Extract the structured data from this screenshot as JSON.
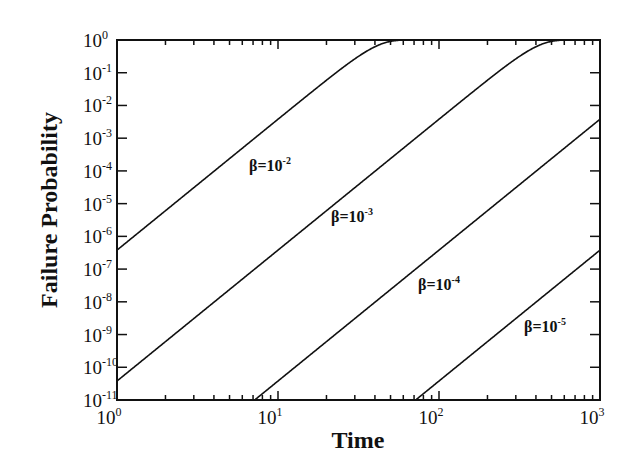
{
  "chart_data": {
    "type": "line",
    "title": "",
    "xlabel": "Time",
    "ylabel": "Failure Probability",
    "xscale": "log",
    "yscale": "log",
    "xlim": [
      1,
      1000
    ],
    "ylim": [
      1e-11,
      1
    ],
    "grid": false,
    "legend": "none (inline curve labels)",
    "x_ticks": [
      {
        "base": "10",
        "exp": "0",
        "value": 1
      },
      {
        "base": "10",
        "exp": "1",
        "value": 10
      },
      {
        "base": "10",
        "exp": "2",
        "value": 100
      },
      {
        "base": "10",
        "exp": "3",
        "value": 1000
      }
    ],
    "y_ticks": [
      {
        "base": "10",
        "exp": "0",
        "value": 0
      },
      {
        "base": "10",
        "exp": "-1",
        "value": -1
      },
      {
        "base": "10",
        "exp": "-2",
        "value": -2
      },
      {
        "base": "10",
        "exp": "-3",
        "value": -3
      },
      {
        "base": "10",
        "exp": "-4",
        "value": -4
      },
      {
        "base": "10",
        "exp": "-5",
        "value": -5
      },
      {
        "base": "10",
        "exp": "-6",
        "value": -6
      },
      {
        "base": "10",
        "exp": "-7",
        "value": -7
      },
      {
        "base": "10",
        "exp": "-8",
        "value": -8
      },
      {
        "base": "10",
        "exp": "-9",
        "value": -9
      },
      {
        "base": "10",
        "exp": "-10",
        "value": -10
      },
      {
        "base": "10",
        "exp": "-11",
        "value": -11
      }
    ],
    "model": "P(t) = 1 - exp(-38*(beta*t)^4) (fitted to curve positions)",
    "series": [
      {
        "name": "β=10^-2",
        "label_prefix": "β=10",
        "label_exp": "-2",
        "beta": 0.01,
        "label_pos": [
          249,
          171
        ],
        "x": [
          1,
          2,
          5,
          10,
          20,
          50,
          100,
          1000
        ],
        "values": [
          3.8e-07,
          6.1e-06,
          0.00024,
          0.0038,
          0.059,
          0.906,
          1.0,
          1.0
        ]
      },
      {
        "name": "β=10^-3",
        "label_prefix": "β=10",
        "label_exp": "-3",
        "beta": 0.001,
        "label_pos": [
          331,
          222
        ],
        "x": [
          1,
          2,
          5,
          10,
          20,
          50,
          100,
          200,
          500,
          1000
        ],
        "values": [
          3.8e-11,
          6.1e-10,
          2.4e-08,
          3.8e-07,
          6.1e-06,
          0.00024,
          0.0038,
          0.059,
          0.906,
          1.0
        ]
      },
      {
        "name": "β=10^-4",
        "label_prefix": "β=10",
        "label_exp": "-4",
        "beta": 0.0001,
        "label_pos": [
          418,
          290
        ],
        "x": [
          7,
          10,
          20,
          50,
          100,
          200,
          500,
          1000
        ],
        "values": [
          9.1e-11,
          3.8e-11,
          6.1e-10,
          2.4e-08,
          3.8e-07,
          6.1e-06,
          0.00024,
          0.0038
        ]
      },
      {
        "name": "β=10^-5",
        "label_prefix": "β=10",
        "label_exp": "-5",
        "beta": 1e-05,
        "label_pos": [
          524,
          332
        ],
        "x": [
          74,
          100,
          200,
          500,
          1000
        ],
        "values": [
          1.1e-11,
          3.8e-11,
          6.1e-10,
          2.4e-08,
          3.8e-07
        ]
      }
    ]
  }
}
